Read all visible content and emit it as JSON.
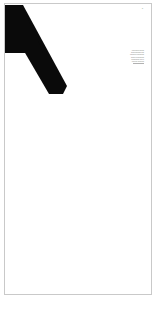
{
  "document": {
    "page_label": "document-page",
    "background_color": "#ffffff",
    "page_color": "#ffffff",
    "border_color": "#c9c9c9"
  },
  "artwork": {
    "name": "letter-a-glyph",
    "description": "large black angular letterform cropped at top-left of page",
    "color": "#0a0a0a"
  },
  "corner_mark": {
    "text": "lll"
  },
  "side_note": {
    "text": "aaaaaaaa aaaaa\naaaaaaaaaaa aaa\naaaaaaa aaaaaaaa\naaaaa aaaaaaaaa\naaaaaaaaa aaa a\naaaaaa aaaaaaa"
  }
}
